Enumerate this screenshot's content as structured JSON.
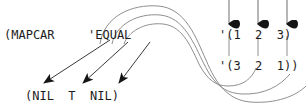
{
  "diagram": {
    "type": "lisp-evaluation-flow",
    "colors": {
      "ink": "#1c1c1c",
      "curve": "#8a8a8a",
      "arrow": "#1a1a1a",
      "background": "#ffffff"
    },
    "code_labels": {
      "mapcar": "(MAPCAR",
      "predicate": "'EQUAL",
      "list_one": "'(1  2  3)",
      "list_two": "'(3  2  1))",
      "result": "(NIL  T  NIL)"
    },
    "list_one_items": [
      "1",
      "2",
      "3"
    ],
    "list_two_items": [
      "3",
      "2",
      "1"
    ],
    "result_items": [
      "NIL",
      "T",
      "NIL"
    ],
    "down_arrows": [
      {
        "name": "arrow-to-list1-item1",
        "x": 229,
        "y_tip": 20
      },
      {
        "name": "arrow-to-list1-item2",
        "x": 258,
        "y_tip": 20
      },
      {
        "name": "arrow-to-list1-item3",
        "x": 287,
        "y_tip": 20
      }
    ],
    "result_arrows": [
      {
        "name": "arrow-to-result-nil1",
        "from_x": 108,
        "from_y": 44,
        "to_x": 43,
        "to_y": 85
      },
      {
        "name": "arrow-to-result-t",
        "from_x": 128,
        "from_y": 44,
        "to_x": 82,
        "to_y": 85
      },
      {
        "name": "arrow-to-result-nil2",
        "from_x": 148,
        "from_y": 44,
        "to_x": 118,
        "to_y": 85
      }
    ],
    "vertical_connectors": [
      {
        "name": "connector-1-to-3",
        "x": 229
      },
      {
        "name": "connector-2-to-2",
        "x": 258
      },
      {
        "name": "connector-3-to-1",
        "x": 287
      }
    ],
    "s_curves": [
      {
        "name": "s-curve-outer"
      },
      {
        "name": "s-curve-middle"
      },
      {
        "name": "s-curve-inner"
      }
    ]
  }
}
